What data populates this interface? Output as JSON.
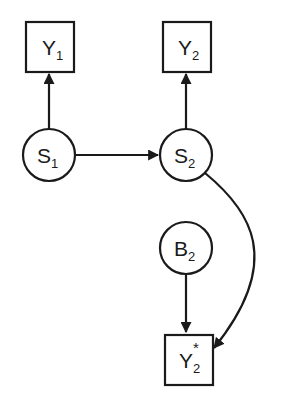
{
  "diagram": {
    "type": "graphical-model",
    "colors": {
      "stroke": "#1a1a1a",
      "background": "#ffffff"
    },
    "nodes": [
      {
        "id": "Y1",
        "shape": "square",
        "base": "Y",
        "sub": "1",
        "sup": ""
      },
      {
        "id": "Y2",
        "shape": "square",
        "base": "Y",
        "sub": "2",
        "sup": ""
      },
      {
        "id": "S1",
        "shape": "circle",
        "base": "S",
        "sub": "1",
        "sup": ""
      },
      {
        "id": "S2",
        "shape": "circle",
        "base": "S",
        "sub": "2",
        "sup": ""
      },
      {
        "id": "B2",
        "shape": "circle",
        "base": "B",
        "sub": "2",
        "sup": ""
      },
      {
        "id": "Y2star",
        "shape": "square",
        "base": "Y",
        "sub": "2",
        "sup": "*"
      }
    ],
    "edges": [
      {
        "from": "S1",
        "to": "Y1",
        "style": "straight"
      },
      {
        "from": "S2",
        "to": "Y2",
        "style": "straight"
      },
      {
        "from": "S1",
        "to": "S2",
        "style": "straight"
      },
      {
        "from": "S2",
        "to": "Y2star",
        "style": "curved"
      },
      {
        "from": "B2",
        "to": "Y2star",
        "style": "straight"
      }
    ]
  }
}
